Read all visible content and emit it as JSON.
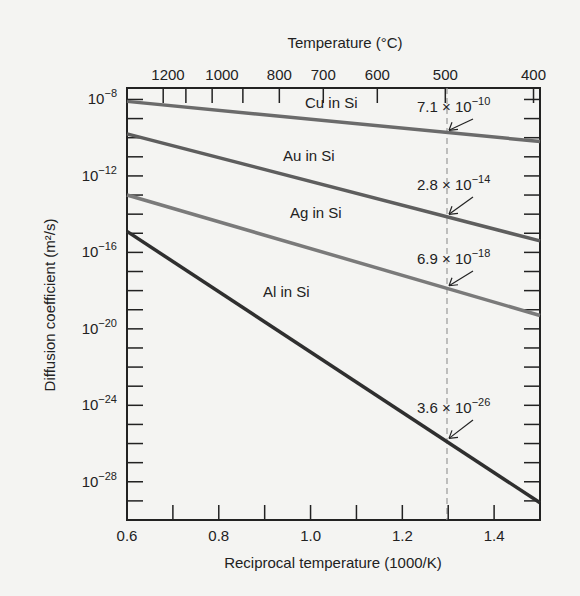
{
  "chart_data": {
    "type": "line",
    "title": "",
    "xlabel": "Reciprocal temperature (1000/K)",
    "ylabel": "Diffusion coefficient (m²/s)",
    "top_xlabel": "Temperature (°C)",
    "x_ticks": [
      "0.6",
      "0.8",
      "1.0",
      "1.2",
      "1.4"
    ],
    "x_tick_values": [
      0.6,
      0.8,
      1.0,
      1.2,
      1.4
    ],
    "top_ticks": [
      "1200",
      "1000",
      "800",
      "700",
      "600",
      "500",
      "400"
    ],
    "top_tick_celsius": [
      1200,
      1000,
      800,
      700,
      600,
      500,
      400
    ],
    "y_ticks": [
      "10^-8",
      "10^-12",
      "10^-16",
      "10^-20",
      "10^-24",
      "10^-28"
    ],
    "y_tick_exponents": [
      -8,
      -12,
      -16,
      -20,
      -24,
      -28
    ],
    "xlim": [
      0.6,
      1.5
    ],
    "ylim_log10": [
      -30,
      -7.4
    ],
    "grid": false,
    "legend": "inline labels",
    "reference_line": {
      "x": 1.293,
      "label": "500 °C",
      "style": "dashed"
    },
    "series": [
      {
        "name": "Cu in Si",
        "x": [
          0.6,
          1.5
        ],
        "log10_y": [
          -8.1,
          -10.2
        ],
        "color": "#6b6b6b",
        "annotation": "7.1 × 10^-10",
        "anno_mantissa": "7.1",
        "anno_exp": "-10"
      },
      {
        "name": "Au in Si",
        "x": [
          0.6,
          1.5
        ],
        "log10_y": [
          -9.8,
          -15.4
        ],
        "color": "#5e5e5e",
        "annotation": "2.8 × 10^-14",
        "anno_mantissa": "2.8",
        "anno_exp": "-14"
      },
      {
        "name": "Ag in Si",
        "x": [
          0.6,
          1.5
        ],
        "log10_y": [
          -13.0,
          -19.3
        ],
        "color": "#7a7a7a",
        "annotation": "6.9 × 10^-18",
        "anno_mantissa": "6.9",
        "anno_exp": "-18"
      },
      {
        "name": "Al in Si",
        "x": [
          0.6,
          1.5
        ],
        "log10_y": [
          -14.9,
          -29.1
        ],
        "color": "#2f2f2f",
        "annotation": "3.6 × 10^-26",
        "anno_mantissa": "3.6",
        "anno_exp": "-26"
      }
    ]
  }
}
